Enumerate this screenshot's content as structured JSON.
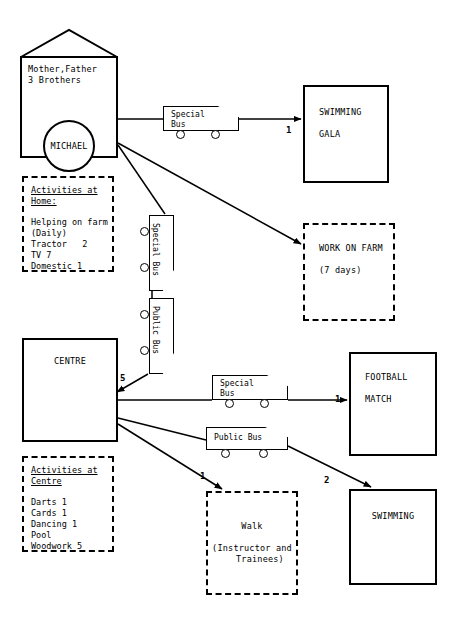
{
  "diagram": {
    "ink_color": "#000000",
    "background": "#ffffff"
  },
  "house": {
    "family_label": "Mother,Father\n3 Brothers",
    "person_label": "MICHAEL"
  },
  "home_activities": {
    "title": "Activities at\nHome:",
    "items": "Helping on farm\n(Daily)\nTractor   2\nTV 7\nDomestic 1"
  },
  "centre_activities": {
    "title": "Activities at\nCentre",
    "items": "Darts 1\nCards 1\nDancing 1\nPool\nWoodwork 5"
  },
  "centre": {
    "label": "CENTRE"
  },
  "destinations": {
    "swimming_gala": "SWIMMING\n\nGALA",
    "work_on_farm": "WORK ON FARM\n\n(7 days)",
    "football_match": "FOOTBALL\n\nMATCH",
    "swimming": "SWIMMING",
    "walk": "Walk\n\n(Instructor and\n   Trainees)"
  },
  "transport": {
    "special_bus_top": "Special\nBus",
    "special_bus_vertical": "Special Bus",
    "public_bus_vertical": "Public Bus",
    "special_bus_mid": "Special\nBus",
    "public_bus_mid": "Public Bus"
  },
  "edge_counts": {
    "gala": "1",
    "centre_in": "5",
    "football": "1",
    "swimming": "2",
    "walk": "1"
  }
}
